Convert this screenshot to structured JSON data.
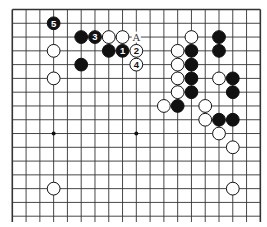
{
  "diagram": {
    "type": "go-board",
    "board_size": 19,
    "visible_rows": 16,
    "top_edge": true,
    "left_edge": true,
    "right_edge": true,
    "bottom_edge": false,
    "colors": {
      "line": "#333333",
      "black": "#111111",
      "white": "#ffffff",
      "background": "#ffffff"
    },
    "star_points": [
      [
        3,
        9
      ],
      [
        9,
        9
      ]
    ],
    "stones": [
      {
        "color": "black",
        "col": 3,
        "row": 1,
        "label": "5"
      },
      {
        "color": "black",
        "col": 5,
        "row": 2,
        "label": ""
      },
      {
        "color": "black",
        "col": 6,
        "row": 2,
        "label": "3"
      },
      {
        "color": "white",
        "col": 7,
        "row": 2,
        "label": ""
      },
      {
        "color": "white",
        "col": 8,
        "row": 2,
        "label": ""
      },
      {
        "color": "white",
        "col": 13,
        "row": 2,
        "label": ""
      },
      {
        "color": "black",
        "col": 15,
        "row": 2,
        "label": ""
      },
      {
        "color": "white",
        "col": 3,
        "row": 3,
        "label": ""
      },
      {
        "color": "black",
        "col": 7,
        "row": 3,
        "label": ""
      },
      {
        "color": "black",
        "col": 8,
        "row": 3,
        "label": "1"
      },
      {
        "color": "white",
        "col": 9,
        "row": 3,
        "label": "2"
      },
      {
        "color": "white",
        "col": 12,
        "row": 3,
        "label": ""
      },
      {
        "color": "black",
        "col": 13,
        "row": 3,
        "label": ""
      },
      {
        "color": "black",
        "col": 15,
        "row": 3,
        "label": ""
      },
      {
        "color": "black",
        "col": 5,
        "row": 4,
        "label": ""
      },
      {
        "color": "white",
        "col": 9,
        "row": 4,
        "label": "4"
      },
      {
        "color": "white",
        "col": 12,
        "row": 4,
        "label": ""
      },
      {
        "color": "black",
        "col": 13,
        "row": 4,
        "label": ""
      },
      {
        "color": "white",
        "col": 3,
        "row": 5,
        "label": ""
      },
      {
        "color": "white",
        "col": 12,
        "row": 5,
        "label": ""
      },
      {
        "color": "black",
        "col": 13,
        "row": 5,
        "label": ""
      },
      {
        "color": "white",
        "col": 15,
        "row": 5,
        "label": ""
      },
      {
        "color": "black",
        "col": 16,
        "row": 5,
        "label": ""
      },
      {
        "color": "white",
        "col": 12,
        "row": 6,
        "label": ""
      },
      {
        "color": "black",
        "col": 13,
        "row": 6,
        "label": ""
      },
      {
        "color": "black",
        "col": 16,
        "row": 6,
        "label": ""
      },
      {
        "color": "white",
        "col": 11,
        "row": 7,
        "label": ""
      },
      {
        "color": "black",
        "col": 12,
        "row": 7,
        "label": ""
      },
      {
        "color": "white",
        "col": 14,
        "row": 7,
        "label": ""
      },
      {
        "color": "white",
        "col": 14,
        "row": 8,
        "label": ""
      },
      {
        "color": "black",
        "col": 15,
        "row": 8,
        "label": ""
      },
      {
        "color": "black",
        "col": 16,
        "row": 8,
        "label": ""
      },
      {
        "color": "white",
        "col": 15,
        "row": 9,
        "label": ""
      },
      {
        "color": "white",
        "col": 16,
        "row": 10,
        "label": ""
      },
      {
        "color": "white",
        "col": 3,
        "row": 13,
        "label": ""
      },
      {
        "color": "white",
        "col": 16,
        "row": 13,
        "label": ""
      }
    ],
    "markers": [
      {
        "col": 9,
        "row": 2,
        "label": "A"
      }
    ]
  }
}
